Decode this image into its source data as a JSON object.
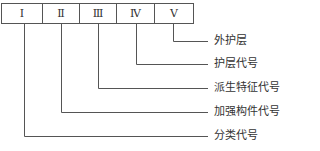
{
  "diagram": {
    "boxes": [
      {
        "label": "Ⅰ"
      },
      {
        "label": "Ⅱ"
      },
      {
        "label": "Ⅲ"
      },
      {
        "label": "Ⅳ"
      },
      {
        "label": "Ⅴ"
      }
    ],
    "labels": [
      {
        "text": "外护层",
        "from_box": 5
      },
      {
        "text": "护层代号",
        "from_box": 4
      },
      {
        "text": "派生特征代号",
        "from_box": 3
      },
      {
        "text": "加强构件代号",
        "from_box": 2
      },
      {
        "text": "分类代号",
        "from_box": 1
      }
    ]
  }
}
